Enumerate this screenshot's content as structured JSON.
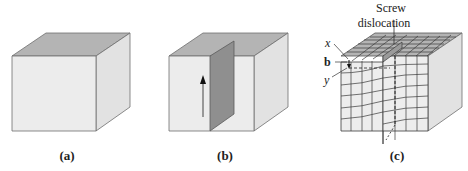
{
  "figure": {
    "panels": [
      {
        "id": "a",
        "caption": "(a)",
        "description": "perfect cubic crystal"
      },
      {
        "id": "b",
        "caption": "(b)",
        "description": "crystal with cut plane and upward shear arrow"
      },
      {
        "id": "c",
        "caption": "(c)",
        "description": "lattice with screw dislocation"
      }
    ],
    "annotations": {
      "title_line1": "Screw",
      "title_line2": "dislocation",
      "label_x": "x",
      "label_b": "b",
      "label_y": "y"
    },
    "colors": {
      "front_face": "#ececec",
      "top_face": "#b4b4b4",
      "side_face": "#e2e2e2",
      "plane": "#8f8f8f",
      "edge": "#6f6f6f",
      "grid": "#3a3a3a"
    }
  }
}
